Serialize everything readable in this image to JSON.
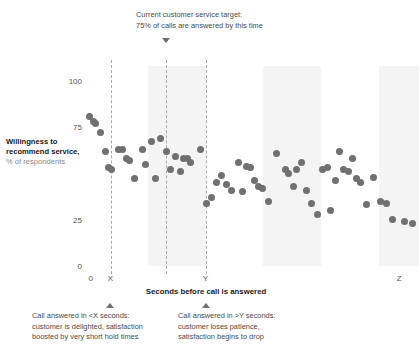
{
  "chart_data": {
    "type": "scatter",
    "title": "",
    "xlabel": "Seconds before call is answered",
    "ylabel_bold": "Willingness to recommend service,",
    "ylabel_sub": "% of respondents",
    "ylim": [
      0,
      108
    ],
    "yticks": [
      100,
      75,
      25,
      0
    ],
    "ytick_labels": [
      "100",
      "75",
      "25",
      "0"
    ],
    "xlim": [
      0,
      100
    ],
    "xticks": [
      0.8,
      6.8,
      35.5,
      94
    ],
    "xtick_labels": [
      "0",
      "X",
      "Y",
      "Z"
    ],
    "grid": false,
    "legend": false,
    "marker_color": "#707070",
    "band_color": "#f4f4f4",
    "guide_color": "#a9a9a9",
    "guides": [
      {
        "name": "x-threshold",
        "x": 6.8
      },
      {
        "name": "service-target",
        "x": 23.5
      },
      {
        "name": "y-threshold",
        "x": 35.5
      }
    ],
    "bands": [
      {
        "x0": 18.0,
        "x1": 35.5
      },
      {
        "x0": 53.0,
        "x1": 70.5
      },
      {
        "x0": 88.0,
        "x1": 100.0
      }
    ],
    "points": [
      {
        "x": 0.6,
        "y": 81
      },
      {
        "x": 1.6,
        "y": 78
      },
      {
        "x": 2.4,
        "y": 77
      },
      {
        "x": 3.9,
        "y": 72
      },
      {
        "x": 5.2,
        "y": 62
      },
      {
        "x": 6.1,
        "y": 53
      },
      {
        "x": 7.0,
        "y": 52
      },
      {
        "x": 9.2,
        "y": 63
      },
      {
        "x": 10.4,
        "y": 63
      },
      {
        "x": 11.5,
        "y": 58
      },
      {
        "x": 12.6,
        "y": 57
      },
      {
        "x": 14.1,
        "y": 47
      },
      {
        "x": 16.6,
        "y": 63
      },
      {
        "x": 17.5,
        "y": 55
      },
      {
        "x": 19.1,
        "y": 67
      },
      {
        "x": 20.4,
        "y": 47
      },
      {
        "x": 21.8,
        "y": 69
      },
      {
        "x": 23.7,
        "y": 62
      },
      {
        "x": 24.8,
        "y": 52
      },
      {
        "x": 26.3,
        "y": 59
      },
      {
        "x": 27.8,
        "y": 51
      },
      {
        "x": 29.0,
        "y": 58
      },
      {
        "x": 30.1,
        "y": 58
      },
      {
        "x": 31.1,
        "y": 56
      },
      {
        "x": 34.0,
        "y": 63
      },
      {
        "x": 35.8,
        "y": 34
      },
      {
        "x": 37.4,
        "y": 37
      },
      {
        "x": 38.9,
        "y": 45
      },
      {
        "x": 40.4,
        "y": 49
      },
      {
        "x": 41.7,
        "y": 44
      },
      {
        "x": 43.5,
        "y": 41
      },
      {
        "x": 45.4,
        "y": 56
      },
      {
        "x": 46.8,
        "y": 40
      },
      {
        "x": 48.0,
        "y": 54
      },
      {
        "x": 49.2,
        "y": 53
      },
      {
        "x": 50.2,
        "y": 46
      },
      {
        "x": 51.4,
        "y": 43
      },
      {
        "x": 52.6,
        "y": 42
      },
      {
        "x": 54.5,
        "y": 35
      },
      {
        "x": 56.9,
        "y": 61
      },
      {
        "x": 59.6,
        "y": 52
      },
      {
        "x": 60.7,
        "y": 50
      },
      {
        "x": 62.0,
        "y": 43
      },
      {
        "x": 63.1,
        "y": 52
      },
      {
        "x": 64.5,
        "y": 56
      },
      {
        "x": 65.9,
        "y": 41
      },
      {
        "x": 67.6,
        "y": 34
      },
      {
        "x": 69.4,
        "y": 28
      },
      {
        "x": 70.8,
        "y": 52
      },
      {
        "x": 72.3,
        "y": 53
      },
      {
        "x": 73.4,
        "y": 30
      },
      {
        "x": 74.9,
        "y": 46
      },
      {
        "x": 76.0,
        "y": 62
      },
      {
        "x": 77.3,
        "y": 52
      },
      {
        "x": 78.6,
        "y": 51
      },
      {
        "x": 79.8,
        "y": 58
      },
      {
        "x": 81.0,
        "y": 47
      },
      {
        "x": 82.3,
        "y": 45
      },
      {
        "x": 84.0,
        "y": 33
      },
      {
        "x": 86.2,
        "y": 48
      },
      {
        "x": 88.4,
        "y": 35
      },
      {
        "x": 90.2,
        "y": 34
      },
      {
        "x": 92.0,
        "y": 25
      },
      {
        "x": 95.5,
        "y": 24
      },
      {
        "x": 98.0,
        "y": 23
      }
    ]
  },
  "annotations": {
    "top": {
      "line1": "Current customer service target:",
      "line2": "75% of calls are answered by this time",
      "marker": "triangle-down"
    },
    "bottom_left": {
      "line1": "Call answered in <X seconds:",
      "line2": "customer is delighted, satisfaction",
      "line3": "boosted by very short hold times",
      "marker": "triangle-up"
    },
    "bottom_right": {
      "line1": "Call answered in >Y seconds:",
      "line2": "customer loses patience,",
      "line3": "satisfaction begins to drop",
      "marker": "triangle-up"
    }
  }
}
